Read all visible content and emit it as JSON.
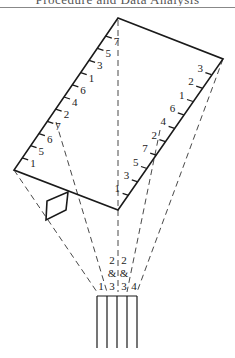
{
  "header": {
    "title": "Procedure and Data Analysis"
  },
  "diagram": {
    "left_scale": [
      "7",
      "5",
      "3",
      "1",
      "6",
      "4",
      "2",
      "7",
      "6",
      "5",
      "1"
    ],
    "right_scale": [
      "3",
      "2",
      "1",
      "6",
      "4",
      "2",
      "7",
      "5",
      "3",
      "1"
    ],
    "finger_labels": {
      "top_row": [
        "2",
        "2"
      ],
      "middle_row": [
        "&",
        "&"
      ],
      "bottom_row": [
        "1",
        "3",
        "3",
        "4"
      ]
    },
    "colors": {
      "line": "#1a1a1a",
      "dash": "#333333",
      "text": "#222222"
    }
  }
}
